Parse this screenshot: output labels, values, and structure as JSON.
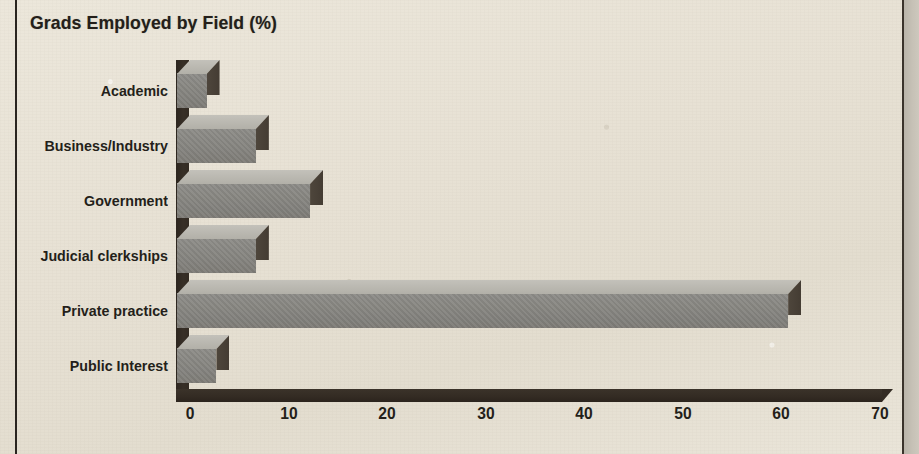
{
  "chart_data": {
    "type": "bar",
    "orientation": "horizontal",
    "title": "Grads Employed by Field (%)",
    "xlabel": "",
    "ylabel": "",
    "xlim": [
      0,
      70
    ],
    "xticks": [
      0,
      10,
      20,
      30,
      40,
      50,
      60,
      70
    ],
    "xtick_labels": [
      "0",
      "10",
      "20",
      "30",
      "40",
      "50",
      "60",
      "70"
    ],
    "grid": false,
    "legend": null,
    "style": "3d-bar",
    "categories": [
      "Academic",
      "Business/Industry",
      "Government",
      "Judicial clerkships",
      "Private practice",
      "Public Interest"
    ],
    "values": [
      3,
      8,
      13.5,
      8,
      62,
      4
    ],
    "units": "%",
    "colors": {
      "bar_front": "#85847f",
      "bar_top": "#b9b7b0",
      "bar_side": "#473f36",
      "axis": "#332b23",
      "text": "#241f1a",
      "background": "#e7e1d4",
      "frame_rule": "#2a2520",
      "right_band": "#c3beb3"
    }
  },
  "frame": {
    "left_rule": "vertical-rule",
    "right_rule": "vertical-rule",
    "right_band": "page-edge-band"
  }
}
